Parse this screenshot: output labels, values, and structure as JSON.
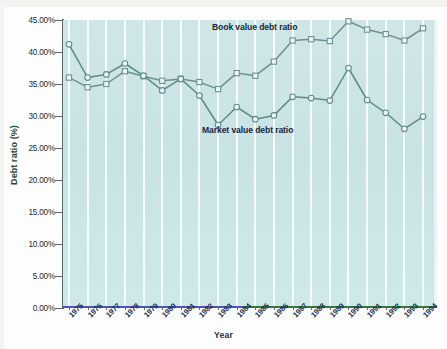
{
  "chart_data": {
    "type": "line",
    "title": "",
    "xlabel": "Year",
    "ylabel": "Debt ratio (%)",
    "categories": [
      "1975",
      "1976",
      "1977",
      "1978",
      "1979",
      "1980",
      "1981",
      "1982",
      "1983",
      "1984",
      "1985",
      "1986",
      "1987",
      "1988",
      "1989",
      "1990",
      "1991",
      "1992",
      "1993",
      "1994"
    ],
    "ylim": [
      0,
      45
    ],
    "ytick_labels": [
      "45.00%",
      "40.00%",
      "35.00%",
      "30.00%",
      "25.00%",
      "20.00%",
      "15.00%",
      "10.00%",
      "5.00%",
      "0.00%"
    ],
    "ytick_values": [
      45,
      40,
      35,
      30,
      25,
      20,
      15,
      10,
      5,
      0
    ],
    "grid": "vertical-only",
    "legend_position": "inline-annotation",
    "series": [
      {
        "name": "Book value debt ratio",
        "marker": "square",
        "color": "#6e8f93",
        "values": [
          36.0,
          34.5,
          35.0,
          37.0,
          36.2,
          35.5,
          35.8,
          35.3,
          34.2,
          36.7,
          36.3,
          38.5,
          41.8,
          42.0,
          41.7,
          44.8,
          43.5,
          42.8,
          41.8,
          43.7
        ]
      },
      {
        "name": "Market value debt ratio",
        "marker": "circle",
        "color": "#5e8a8c",
        "values": [
          41.2,
          36.0,
          36.5,
          38.2,
          36.3,
          34.0,
          35.8,
          33.2,
          28.6,
          31.4,
          29.5,
          30.1,
          33.0,
          32.8,
          32.4,
          37.5,
          32.5,
          30.5,
          28.0,
          29.9
        ]
      }
    ],
    "annotations": [
      {
        "text": "Book value debt ratio",
        "near": "1987"
      },
      {
        "text": "Market value debt ratio",
        "near": "1985"
      }
    ],
    "plot_background": "#cbe4e5",
    "baseline_left_color": "#4a52c8",
    "baseline_right_color": "#2f7a3a"
  },
  "axes": {
    "ytitle": "Debt ratio (%)",
    "xtitle": "Year"
  },
  "caption": {
    "text": ""
  }
}
